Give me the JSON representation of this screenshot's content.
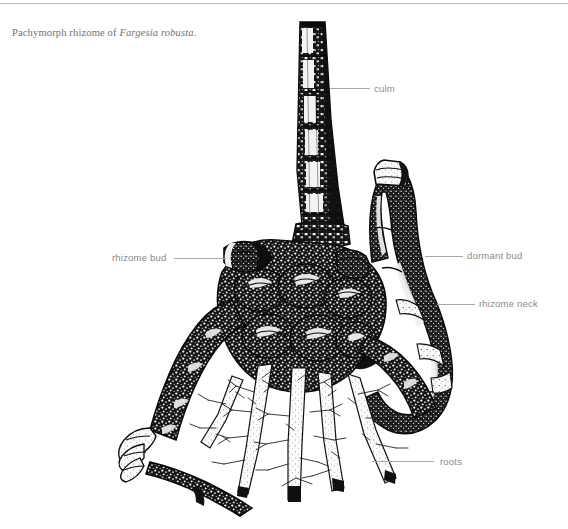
{
  "page": {
    "background_color": "#ffffff",
    "top_rule_color": "#b8b8b8"
  },
  "caption": {
    "prefix": "Pachymorph rhizome of ",
    "species": "Fargesia robusta",
    "suffix": "."
  },
  "figure": {
    "kind": "botanical-line-illustration",
    "ink_color": "#111111",
    "paper_color": "#ffffff",
    "parts": [
      "culm",
      "rhizome bud",
      "dormant bud",
      "rhizome neck",
      "roots"
    ]
  },
  "labels": [
    {
      "id": "culm",
      "text": "culm",
      "text_x": 374,
      "text_y": 83,
      "leader_x": 330,
      "leader_y": 88,
      "leader_w": 40,
      "align": "left"
    },
    {
      "id": "rhizome-bud",
      "text": "rhizome bud",
      "text_x": 112,
      "text_y": 252,
      "leader_x": 174,
      "leader_y": 258,
      "leader_w": 52,
      "align": "right"
    },
    {
      "id": "dormant-bud",
      "text": "dormant bud",
      "text_x": 467,
      "text_y": 250,
      "leader_x": 425,
      "leader_y": 256,
      "leader_w": 38,
      "align": "left"
    },
    {
      "id": "rhizome-neck",
      "text": "rhizome neck",
      "text_x": 479,
      "text_y": 298,
      "leader_x": 437,
      "leader_y": 304,
      "leader_w": 38,
      "align": "left"
    },
    {
      "id": "roots",
      "text": "roots",
      "text_x": 440,
      "text_y": 456,
      "leader_x": 372,
      "leader_y": 461,
      "leader_w": 62,
      "align": "left"
    }
  ],
  "label_style": {
    "text_color": "#8a8a8a",
    "leader_color": "#a9a9a9",
    "font_size_px": 9.5
  }
}
